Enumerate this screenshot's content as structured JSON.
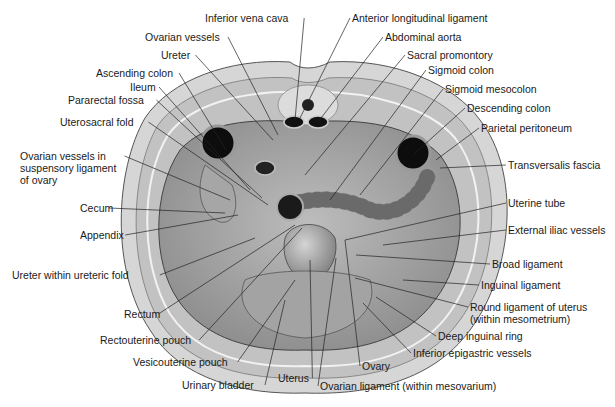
{
  "figure": {
    "palette": {
      "skin": "#d9d9d9",
      "muscle": "#c6c6c6",
      "fascia": "#efefef",
      "cavity": "#a8a8a8",
      "organ": "#8f8f8f",
      "lumen": "#111111",
      "line": "#222222"
    }
  },
  "labels": {
    "left": [
      {
        "id": "inferior-vena-cava",
        "text": "Inferior vena cava",
        "x": 205,
        "y": 18,
        "tx": 295,
        "ty": 120
      },
      {
        "id": "ovarian-vessels",
        "text": "Ovarian vessels",
        "x": 145,
        "y": 37,
        "tx": 278,
        "ty": 135
      },
      {
        "id": "ureter",
        "text": "Ureter",
        "x": 161,
        "y": 55,
        "tx": 273,
        "ty": 140
      },
      {
        "id": "ascending-colon",
        "text": "Ascending colon",
        "x": 96,
        "y": 73,
        "tx": 226,
        "ty": 150
      },
      {
        "id": "ileum",
        "text": "Ileum",
        "x": 130,
        "y": 87,
        "tx": 250,
        "ty": 190
      },
      {
        "id": "pararectal-fossa",
        "text": "Pararectal fossa",
        "x": 68,
        "y": 100,
        "tx": 262,
        "ty": 198
      },
      {
        "id": "uterosacral-fold",
        "text": "Uterosacral fold",
        "x": 60,
        "y": 122,
        "tx": 268,
        "ty": 205
      },
      {
        "id": "ovarian-vessels-suspensory",
        "text": "Ovarian vessels in\nsuspensory ligament\nof ovary",
        "x": 20,
        "y": 156,
        "tx": 230,
        "ty": 200
      },
      {
        "id": "cecum",
        "text": "Cecum",
        "x": 80,
        "y": 208,
        "tx": 225,
        "ty": 213
      },
      {
        "id": "appendix",
        "text": "Appendix",
        "x": 80,
        "y": 235,
        "tx": 238,
        "ty": 215
      },
      {
        "id": "ureter-within-ureteric-fold",
        "text": "Ureter within ureteric fold",
        "x": 12,
        "y": 275,
        "tx": 255,
        "ty": 238
      },
      {
        "id": "rectum",
        "text": "Rectum",
        "x": 124,
        "y": 314,
        "tx": 295,
        "ty": 225
      },
      {
        "id": "rectouterine-pouch",
        "text": "Rectouterine pouch",
        "x": 100,
        "y": 340,
        "tx": 302,
        "ty": 228
      },
      {
        "id": "vesicouterine-pouch",
        "text": "Vesicouterine pouch",
        "x": 133,
        "y": 362,
        "tx": 295,
        "ty": 280
      },
      {
        "id": "urinary-bladder",
        "text": "Urinary bladder",
        "x": 182,
        "y": 385,
        "tx": 285,
        "ty": 300
      },
      {
        "id": "uterus",
        "text": "Uterus",
        "x": 278,
        "y": 378,
        "tx": 310,
        "ty": 260
      }
    ],
    "right": [
      {
        "id": "anterior-longitudinal-ligament",
        "text": "Anterior longitudinal ligament",
        "x": 352,
        "y": 18,
        "tx": 300,
        "ty": 118
      },
      {
        "id": "abdominal-aorta",
        "text": "Abdominal aorta",
        "x": 385,
        "y": 37,
        "tx": 318,
        "ty": 122
      },
      {
        "id": "sacral-promontory",
        "text": "Sacral promontory",
        "x": 407,
        "y": 55,
        "tx": 305,
        "ty": 175
      },
      {
        "id": "sigmoid-colon",
        "text": "Sigmoid colon",
        "x": 428,
        "y": 70,
        "tx": 330,
        "ty": 200
      },
      {
        "id": "sigmoid-mesocolon",
        "text": "Sigmoid mesocolon",
        "x": 445,
        "y": 89,
        "tx": 360,
        "ty": 195
      },
      {
        "id": "descending-colon",
        "text": "Descending colon",
        "x": 467,
        "y": 108,
        "tx": 413,
        "ty": 155
      },
      {
        "id": "parietal-peritoneum",
        "text": "Parietal peritoneum",
        "x": 481,
        "y": 128,
        "tx": 436,
        "ty": 160
      },
      {
        "id": "transversalis-fascia",
        "text": "Transversalis fascia",
        "x": 508,
        "y": 165,
        "tx": 440,
        "ty": 168
      },
      {
        "id": "uterine-tube",
        "text": "Uterine tube",
        "x": 508,
        "y": 203,
        "tx": 345,
        "ty": 240
      },
      {
        "id": "external-iliac-vessels",
        "text": "External iliac vessels",
        "x": 508,
        "y": 230,
        "tx": 383,
        "ty": 245
      },
      {
        "id": "broad-ligament",
        "text": "Broad ligament",
        "x": 492,
        "y": 264,
        "tx": 356,
        "ty": 255
      },
      {
        "id": "inguinal-ligament",
        "text": "Inguinal ligament",
        "x": 481,
        "y": 285,
        "tx": 403,
        "ty": 280
      },
      {
        "id": "round-ligament-of-uterus",
        "text": "Round ligament of uterus\n(within mesometrium)",
        "x": 470,
        "y": 307,
        "tx": 355,
        "ty": 278
      },
      {
        "id": "deep-inguinal-ring",
        "text": "Deep inguinal ring",
        "x": 438,
        "y": 336,
        "tx": 376,
        "ty": 297
      },
      {
        "id": "inferior-epigastric-vessels",
        "text": "Inferior epigastric vessels",
        "x": 413,
        "y": 353,
        "tx": 363,
        "ty": 303
      },
      {
        "id": "ovary",
        "text": "Ovary",
        "x": 362,
        "y": 366,
        "tx": 345,
        "ty": 240
      },
      {
        "id": "ovarian-ligament-within-mesovarium",
        "text": "Ovarian ligament (within mesovarium)",
        "x": 320,
        "y": 386,
        "tx": 336,
        "ty": 258
      }
    ]
  }
}
